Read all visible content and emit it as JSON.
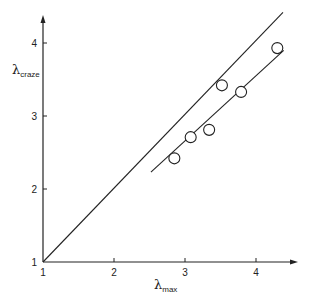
{
  "chart_data": {
    "type": "scatter",
    "title": "",
    "xlabel": "λmax",
    "ylabel": "λcraze",
    "xlabel_parts": {
      "symbol": "λ",
      "subscript": "max"
    },
    "ylabel_parts": {
      "symbol": "λ",
      "subscript": "craze"
    },
    "xlim": [
      1,
      4.55
    ],
    "ylim": [
      1,
      4.65
    ],
    "xticks": [
      1,
      2,
      3,
      4
    ],
    "yticks": [
      1,
      2,
      3,
      4
    ],
    "xtick_labels": [
      "1",
      "2",
      "3",
      "4"
    ],
    "ytick_labels": [
      "1",
      "2",
      "3",
      "4"
    ],
    "grid": false,
    "legend": null,
    "series": [
      {
        "name": "data",
        "marker": "open-circle",
        "points": [
          {
            "x": 2.85,
            "y": 2.42
          },
          {
            "x": 3.08,
            "y": 2.71
          },
          {
            "x": 3.34,
            "y": 2.81
          },
          {
            "x": 3.52,
            "y": 3.42
          },
          {
            "x": 3.79,
            "y": 3.33
          },
          {
            "x": 4.3,
            "y": 3.93
          }
        ]
      },
      {
        "name": "identity line (λcraze = λmax)",
        "type": "line",
        "points": [
          {
            "x": 1.0,
            "y": 1.0
          },
          {
            "x": 4.38,
            "y": 4.42
          }
        ]
      },
      {
        "name": "fit line",
        "type": "line",
        "points": [
          {
            "x": 2.52,
            "y": 2.23
          },
          {
            "x": 4.39,
            "y": 3.9
          }
        ]
      }
    ]
  }
}
